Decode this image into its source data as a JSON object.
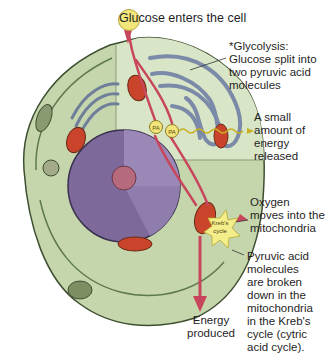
{
  "diagram": {
    "title_label": {
      "prefix": "G",
      "rest": "lucose enters the cell"
    },
    "labels": {
      "glycolysis": "*Glycolysis:\n  Glucose split into\n  two pyruvic acid\n  molecules",
      "energy_small": "A small\namount of\nenergy\nreleased",
      "oxygen": "Oxygen\nmoves into the\nmitochondria",
      "pyruvic": "Pyruvic acid\nmolecules\nare broken\ndown in the\nmitochondria\nin the Kreb's\ncycle (cytric\nacid cycle).",
      "energy_produced": "Energy\nproduced"
    },
    "inner_labels": {
      "pa1": "PA",
      "pa2": "PA",
      "kreb": "Kreb's",
      "cycle": "cycle"
    },
    "colors": {
      "cytoplasm": "#c5d6ad",
      "cytoplasm_light": "#d6e3c2",
      "membrane": "#6f8a5a",
      "nucleus": "#7d6a9a",
      "nucleus_light": "#9a88b6",
      "nucleolus": "#b56a7e",
      "mitochondria": "#c9442a",
      "er": "#7b8aa8",
      "arrow": "#d2566a",
      "glucose": "#f2e57a",
      "kreb_star": "#f4ee8a"
    }
  }
}
